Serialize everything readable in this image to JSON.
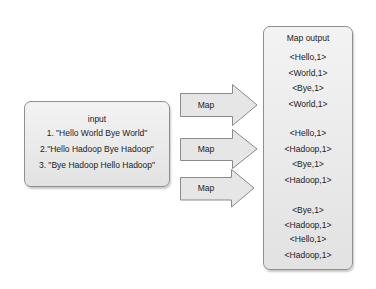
{
  "diagram": {
    "type": "mapreduce-map-phase",
    "input": {
      "title": "input",
      "lines": [
        "1. \"Hello World Bye World\"",
        "2.\"Hello Hadoop Bye Hadoop\"",
        "3. \"Bye Hadoop Hello Hadoop\""
      ]
    },
    "arrows": [
      {
        "label": "Map"
      },
      {
        "label": "Map"
      },
      {
        "label": "Map"
      }
    ],
    "output": {
      "title": "Map  output",
      "groups": [
        [
          "<Hello,1>",
          "<World,1>",
          "<Bye,1>",
          "<World,1>"
        ],
        [
          "<Hello,1>",
          "<Hadoop,1>",
          "<Bye,1>",
          "<Hadoop,1>"
        ],
        [
          "<Bye,1>",
          "<Hadoop,1>",
          "<Hello,1>",
          "<Hadoop,1>"
        ]
      ]
    },
    "colors": {
      "box_fill": "#ececec",
      "box_border": "#8f8f8f",
      "arrow_fill": "#e6e6e6",
      "arrow_border": "#8a8a8a",
      "text": "#1a1a1a"
    }
  }
}
